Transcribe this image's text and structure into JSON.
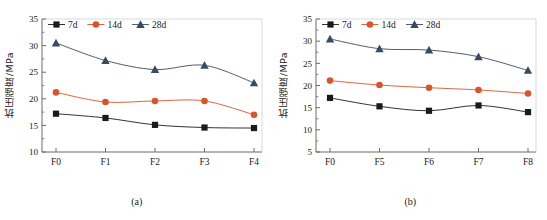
{
  "figure": {
    "ylabel": "抗压强度/MPa",
    "panels": [
      {
        "caption": "(a)",
        "legend_labels": [
          "7d",
          "14d",
          "28d"
        ],
        "categories": [
          "F0",
          "F1",
          "F2",
          "F3",
          "F4"
        ],
        "yticks": [
          "10",
          "15",
          "20",
          "25",
          "30",
          "35"
        ]
      },
      {
        "caption": "(b)",
        "legend_labels": [
          "7d",
          "14d",
          "28d"
        ],
        "categories": [
          "F0",
          "F5",
          "F6",
          "F7",
          "F8"
        ],
        "yticks": [
          "5",
          "10",
          "15",
          "20",
          "25",
          "30",
          "35"
        ]
      }
    ]
  },
  "colors": {
    "series_7d": "#1a1a1a",
    "series_14d": "#d9542b",
    "series_28d": "#3b4a63",
    "axis": "#6b6b6b",
    "background": "#ffffff"
  },
  "chart_data": [
    {
      "type": "line",
      "title": "(a)",
      "xlabel": "",
      "ylabel": "抗压强度/MPa",
      "categories": [
        "F0",
        "F1",
        "F2",
        "F3",
        "F4"
      ],
      "ylim": [
        10,
        35
      ],
      "yticks": [
        10,
        15,
        20,
        25,
        30,
        35
      ],
      "grid": false,
      "legend_position": "top-left-inside",
      "series": [
        {
          "name": "7d",
          "marker": "square",
          "color": "#1a1a1a",
          "values": [
            17.2,
            16.4,
            15.1,
            14.6,
            14.5
          ]
        },
        {
          "name": "14d",
          "marker": "circle",
          "color": "#d9542b",
          "values": [
            21.2,
            19.4,
            19.6,
            19.6,
            17.0
          ]
        },
        {
          "name": "28d",
          "marker": "triangle",
          "color": "#3b4a63",
          "values": [
            30.5,
            27.2,
            25.5,
            26.3,
            23.0
          ]
        }
      ]
    },
    {
      "type": "line",
      "title": "(b)",
      "xlabel": "",
      "ylabel": "抗压强度/MPa",
      "categories": [
        "F0",
        "F5",
        "F6",
        "F7",
        "F8"
      ],
      "ylim": [
        5,
        35
      ],
      "yticks": [
        5,
        10,
        15,
        20,
        25,
        30,
        35
      ],
      "grid": false,
      "legend_position": "top-left-inside",
      "series": [
        {
          "name": "7d",
          "marker": "square",
          "color": "#1a1a1a",
          "values": [
            17.2,
            15.3,
            14.3,
            15.5,
            14.0
          ]
        },
        {
          "name": "14d",
          "marker": "circle",
          "color": "#d9542b",
          "values": [
            21.1,
            20.1,
            19.5,
            19.0,
            18.2
          ]
        },
        {
          "name": "28d",
          "marker": "triangle",
          "color": "#3b4a63",
          "values": [
            30.5,
            28.3,
            28.0,
            26.5,
            23.4
          ]
        }
      ]
    }
  ]
}
